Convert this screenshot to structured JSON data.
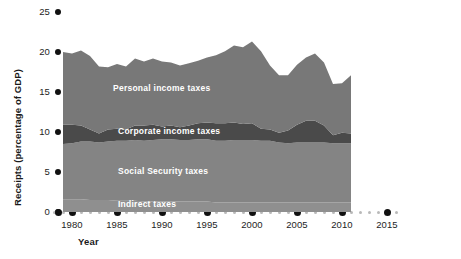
{
  "chart_data": {
    "type": "area",
    "title": "",
    "xlabel": "Year",
    "ylabel": "Receipts (percentage of GDP)",
    "xlim": [
      1979,
      2016
    ],
    "ylim": [
      0,
      25
    ],
    "grid": false,
    "legend_position": "inline-band-labels",
    "stacked": true,
    "xticks": [
      "1980",
      "1985",
      "1990",
      "1995",
      "2000",
      "2005",
      "2010",
      "2015"
    ],
    "xtick_values": [
      1980,
      1985,
      1990,
      1995,
      2000,
      2005,
      2010,
      2015
    ],
    "yticks": [
      "0",
      "5",
      "10",
      "15",
      "20",
      "25"
    ],
    "ytick_values": [
      0,
      5,
      10,
      15,
      20,
      25
    ],
    "x": [
      1979,
      1980,
      1981,
      1982,
      1983,
      1984,
      1985,
      1986,
      1987,
      1988,
      1989,
      1990,
      1991,
      1992,
      1993,
      1994,
      1995,
      1996,
      1997,
      1998,
      1999,
      2000,
      2001,
      2002,
      2003,
      2004,
      2005,
      2006,
      2007,
      2008,
      2009,
      2010,
      2011
    ],
    "series": [
      {
        "name": "Indirect taxes",
        "color": "#8f8f8f",
        "values": [
          1.6,
          1.6,
          1.6,
          1.5,
          1.5,
          1.5,
          1.4,
          1.4,
          1.4,
          1.3,
          1.3,
          1.3,
          1.3,
          1.3,
          1.3,
          1.3,
          1.3,
          1.2,
          1.2,
          1.2,
          1.2,
          1.2,
          1.2,
          1.2,
          1.2,
          1.2,
          1.2,
          1.2,
          1.2,
          1.2,
          1.2,
          1.2,
          1.2
        ]
      },
      {
        "name": "Social Security taxes",
        "color": "#848484",
        "values": [
          6.9,
          7.0,
          7.2,
          7.3,
          7.2,
          7.3,
          7.5,
          7.5,
          7.6,
          7.6,
          7.7,
          7.8,
          7.8,
          7.7,
          7.7,
          7.8,
          7.8,
          7.7,
          7.7,
          7.8,
          7.8,
          7.8,
          7.7,
          7.7,
          7.5,
          7.4,
          7.5,
          7.5,
          7.5,
          7.5,
          7.4,
          7.4,
          7.4
        ]
      },
      {
        "name": "Corporate income taxes",
        "color": "#4a4a4a",
        "values": [
          2.4,
          2.3,
          2.0,
          1.5,
          1.1,
          1.5,
          1.5,
          1.4,
          1.8,
          1.9,
          1.9,
          1.6,
          1.7,
          1.6,
          1.8,
          2.0,
          2.1,
          2.2,
          2.2,
          2.2,
          2.0,
          2.1,
          1.5,
          1.4,
          1.2,
          1.6,
          2.2,
          2.7,
          2.7,
          2.1,
          1.0,
          1.3,
          1.2
        ]
      },
      {
        "name": "Personal income taxes",
        "color": "#787878",
        "values": [
          9.1,
          8.9,
          9.4,
          9.2,
          8.4,
          7.8,
          8.1,
          7.9,
          8.4,
          8.0,
          8.3,
          8.1,
          7.9,
          7.7,
          7.8,
          7.8,
          8.1,
          8.5,
          9.0,
          9.6,
          9.6,
          10.2,
          9.7,
          8.0,
          7.2,
          6.9,
          7.5,
          7.9,
          8.4,
          7.9,
          6.4,
          6.2,
          7.3
        ]
      }
    ],
    "band_labels": [
      {
        "text": "Personal income taxes",
        "x_px": 113,
        "y_px": 83
      },
      {
        "text": "Corporate income taxes",
        "x_px": 118,
        "y_px": 126
      },
      {
        "text": "Social Security taxes",
        "x_px": 118,
        "y_px": 166
      },
      {
        "text": "Indirect taxes",
        "x_px": 118,
        "y_px": 199
      }
    ]
  },
  "axes": {
    "y_title": "Receipts (percentage of GDP)",
    "x_title": "Year"
  }
}
